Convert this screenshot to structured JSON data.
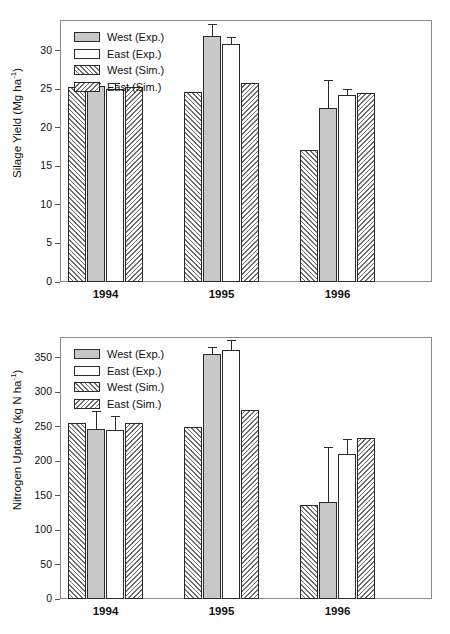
{
  "chart_data": [
    {
      "panel_id": "silage-yield",
      "type": "bar",
      "title": "",
      "xlabel": "",
      "ylabel": "Silage Yield (Mg ha-1)",
      "ylabel_base": "Silage Yield (Mg ha",
      "ylabel_sup": "-1",
      "ylabel_tail": ")",
      "ylim": [
        0,
        34
      ],
      "yticks": [
        0,
        5,
        10,
        15,
        20,
        25,
        30
      ],
      "ytick_labels": [
        "0",
        "5",
        "10",
        "15",
        "20",
        "25",
        "30"
      ],
      "grid": false,
      "legend_position": "top-left",
      "categories": [
        "1994",
        "1995",
        "1996"
      ],
      "series": [
        {
          "name": "West (Sim.)",
          "style": "hatch-forward",
          "values": [
            25.3,
            24.7,
            17.1
          ],
          "errors": [
            null,
            null,
            null
          ]
        },
        {
          "name": "West (Exp.)",
          "style": "solid-gray",
          "values": [
            25.4,
            31.9,
            22.6
          ],
          "errors": [
            0.45,
            1.6,
            3.6
          ]
        },
        {
          "name": "East (Exp.)",
          "style": "solid-white",
          "values": [
            25.1,
            30.9,
            24.3
          ],
          "errors": [
            0.7,
            0.95,
            0.75
          ]
        },
        {
          "name": "East (Sim.)",
          "style": "hatch-back",
          "values": [
            25.3,
            25.8,
            24.5
          ],
          "errors": [
            null,
            null,
            null
          ]
        }
      ]
    },
    {
      "panel_id": "nitrogen-uptake",
      "type": "bar",
      "title": "",
      "xlabel": "",
      "ylabel": "Nitrogen Uptake (kg N ha-1)",
      "ylabel_base": "Nitrogen Uptake (kg N ha",
      "ylabel_sup": "-1",
      "ylabel_tail": ")",
      "ylim": [
        0,
        380
      ],
      "yticks": [
        0,
        50,
        100,
        150,
        200,
        250,
        300,
        350
      ],
      "ytick_labels": [
        "0",
        "50",
        "100",
        "150",
        "200",
        "250",
        "300",
        "350"
      ],
      "grid": false,
      "legend_position": "top-left",
      "categories": [
        "1994",
        "1995",
        "1996"
      ],
      "series": [
        {
          "name": "West (Sim.)",
          "style": "hatch-forward",
          "values": [
            256,
            249,
            137
          ],
          "errors": [
            null,
            null,
            null
          ]
        },
        {
          "name": "West (Exp.)",
          "style": "solid-gray",
          "values": [
            246,
            356,
            141
          ],
          "errors": [
            27,
            9,
            80
          ]
        },
        {
          "name": "East (Exp.)",
          "style": "solid-white",
          "values": [
            245,
            361,
            211
          ],
          "errors": [
            21,
            14,
            21
          ]
        },
        {
          "name": "East (Sim.)",
          "style": "hatch-back",
          "values": [
            256,
            274,
            234
          ],
          "errors": [
            null,
            null,
            null
          ]
        }
      ]
    }
  ],
  "legend": {
    "items": [
      {
        "label": "West (Exp.)",
        "style": "solid-gray"
      },
      {
        "label": "East (Exp.)",
        "style": "solid-white"
      },
      {
        "label": "West (Sim.)",
        "style": "hatch-forward"
      },
      {
        "label": "East (Sim.)",
        "style": "hatch-back"
      }
    ]
  },
  "colors": {
    "bar_gray": "#c8c8c8",
    "bar_white": "#ffffff",
    "bar_outline": "#2b2b2b",
    "hatch_line": "#6e6e6e",
    "frame": "#8a8a8a",
    "text": "#111111"
  }
}
